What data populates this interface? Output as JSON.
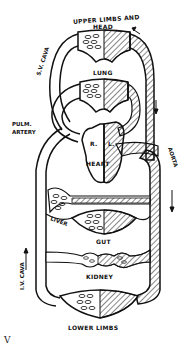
{
  "diagram": {
    "labels": {
      "upper_limbs_line1": "UPPER LIMBS AND",
      "upper_limbs_line2": "HEAD",
      "sv_cava": "S.V. CAVA",
      "lung": "LUNG",
      "pulm_artery_line1": "PULM.",
      "pulm_artery_line2": "ARTERY",
      "right": "R.",
      "left": "L.",
      "heart": "HEART",
      "aorta": "AORTA",
      "liver": "LIVER",
      "gut": "GUT",
      "iv_cava": "I.V. CAVA",
      "kidney": "KIDNEY",
      "lower_limbs": "LOWER LIMBS"
    },
    "caption_fragment": "V"
  },
  "colors": {
    "ink": "#111111",
    "background": "#ffffff"
  }
}
